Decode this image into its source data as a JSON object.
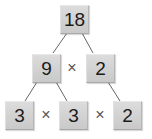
{
  "diagram": {
    "type": "factor-tree",
    "root": {
      "value": "18"
    },
    "level1": [
      {
        "value": "9"
      },
      {
        "value": "2"
      }
    ],
    "level1_operator": "×",
    "level2": [
      {
        "value": "3"
      },
      {
        "value": "3"
      },
      {
        "value": "2"
      }
    ],
    "level2_operators": [
      "×",
      "×"
    ],
    "colors": {
      "box": "#d3d3d3",
      "line": "#666666",
      "text": "#1a1a1a",
      "operator": "#555555"
    }
  }
}
